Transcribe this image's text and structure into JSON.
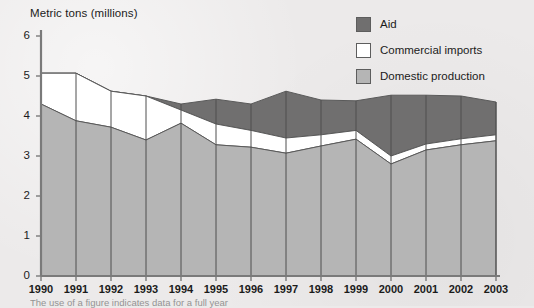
{
  "figure": {
    "axis_title": "Metric tons (millions)",
    "footnote": "The use of a figure indicates data for a full year"
  },
  "legend": {
    "position": "top-right",
    "items": [
      {
        "label": "Aid",
        "color": "#706f6f",
        "name": "aid"
      },
      {
        "label": "Commercial imports",
        "color": "#ffffff",
        "name": "commercial-imports"
      },
      {
        "label": "Domestic production",
        "color": "#b5b5b5",
        "name": "domestic-production"
      }
    ]
  },
  "axes": {
    "y_ticks": [
      "0",
      "1",
      "2",
      "3",
      "4",
      "5",
      "6"
    ],
    "x_ticks": [
      "1990",
      "1991",
      "1992",
      "1993",
      "1994",
      "1995",
      "1996",
      "1997",
      "1998",
      "1999",
      "2000",
      "2001",
      "2002",
      "2003"
    ]
  },
  "chart_data": {
    "type": "area",
    "stacked": true,
    "title": "",
    "subtitle": "",
    "xlabel": "",
    "ylabel": "Metric tons (millions)",
    "ylim": [
      0,
      6
    ],
    "grid": "vertical-year-lines",
    "legend_position": "top-right",
    "x": [
      "1990",
      "1991",
      "1992",
      "1993",
      "1994",
      "1995",
      "1996",
      "1997",
      "1998",
      "1999",
      "2000",
      "2001",
      "2002",
      "2003"
    ],
    "categories": [
      "1990",
      "1991",
      "1992",
      "1993",
      "1994",
      "1995",
      "1996",
      "1997",
      "1998",
      "1999",
      "2000",
      "2001",
      "2002",
      "2003"
    ],
    "series": [
      {
        "name": "Domestic production",
        "color": "#b5b5b5",
        "stack_order": 1,
        "values": [
          4.3,
          3.88,
          3.72,
          3.4,
          3.82,
          3.28,
          3.22,
          3.07,
          3.25,
          3.42,
          2.8,
          3.15,
          3.28,
          3.38
        ]
      },
      {
        "name": "Commercial imports",
        "color": "#ffffff",
        "stack_order": 2,
        "values": [
          0.77,
          1.19,
          0.9,
          1.1,
          0.33,
          0.52,
          0.42,
          0.38,
          0.28,
          0.22,
          0.2,
          0.15,
          0.15,
          0.15
        ]
      },
      {
        "name": "Aid",
        "color": "#706f6f",
        "stack_order": 3,
        "values": [
          0.0,
          0.0,
          0.0,
          0.0,
          0.15,
          0.62,
          0.66,
          1.17,
          0.87,
          0.74,
          1.52,
          1.22,
          1.07,
          0.82
        ]
      }
    ],
    "cumulative_totals": [
      5.07,
      5.07,
      4.62,
      4.5,
      4.3,
      4.42,
      4.3,
      4.62,
      4.4,
      4.38,
      4.52,
      4.52,
      4.5,
      4.35
    ]
  },
  "geometry": {
    "x0": 41,
    "dx": 35,
    "y0": 276,
    "unit": 40
  }
}
